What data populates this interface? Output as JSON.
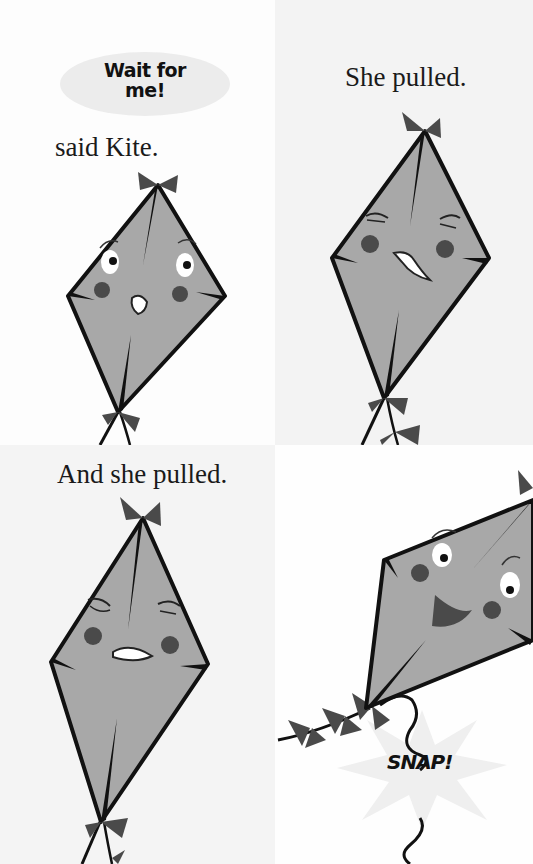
{
  "page": {
    "type": "picture book spread",
    "panels": [
      {
        "id": "top-left",
        "speech_bubble": {
          "line1": "Wait for",
          "line2": "me!"
        },
        "narration": "said Kite.",
        "kite_expression": "surprised"
      },
      {
        "id": "top-right",
        "narration": "She pulled.",
        "kite_expression": "straining"
      },
      {
        "id": "bottom-left",
        "narration": "And she pulled.",
        "kite_expression": "straining hard"
      },
      {
        "id": "bottom-right",
        "sound_effect": "SNAP!",
        "kite_expression": "happy, free"
      }
    ]
  },
  "colors": {
    "kite_fill": "#a8a8a8",
    "outline": "#111111",
    "bow": "#4a4a4a",
    "cheek": "#4a4a4a",
    "bubble": "#ececec"
  }
}
